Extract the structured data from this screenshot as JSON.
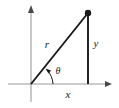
{
  "figure": {
    "kind": "right-triangle-trigonometry-diagram",
    "background_color": "#ffffff",
    "axis_color": "#9a9a9a",
    "triangle_color": "#1a1a1a",
    "labels": {
      "hypotenuse": "r",
      "vertical_leg": "y",
      "horizontal_leg": "x",
      "angle": "θ"
    },
    "geometry": {
      "origin": {
        "x": 31,
        "y": 84
      },
      "point": {
        "x": 88,
        "y": 13
      },
      "foot": {
        "x": 88,
        "y": 84
      },
      "x_axis": {
        "x1": 8,
        "y1": 84,
        "x2": 112,
        "y2": 84
      },
      "y_axis": {
        "x1": 31,
        "y1": 6,
        "x2": 31,
        "y2": 102
      },
      "angle_arc_radius": 20
    },
    "label_positions": {
      "hypotenuse": {
        "x": 47,
        "y": 48
      },
      "vertical_leg": {
        "x": 95,
        "y": 47
      },
      "horizontal_leg": {
        "x": 67,
        "y": 97
      },
      "angle": {
        "x": 56,
        "y": 73
      }
    }
  }
}
